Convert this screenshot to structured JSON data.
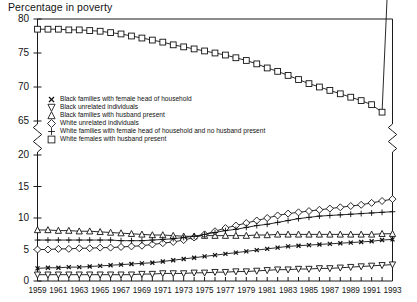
{
  "chart_data": {
    "type": "line",
    "title": "Percentage in poverty",
    "xlabel": "",
    "ylabel": "Percentage in poverty",
    "grid": false,
    "legend_position": "inside-upper-left",
    "axis_break": {
      "present": true,
      "between": [
        65,
        20
      ],
      "style": "zigzag",
      "on": [
        "y-axis-left",
        "y-axis-right"
      ]
    },
    "ylim_upper": [
      65,
      80
    ],
    "ylim_lower": [
      0,
      20
    ],
    "ytick_labels": [
      "80",
      "75",
      "70",
      "65",
      "20",
      "15",
      "10",
      "5",
      "0"
    ],
    "ytick_values": [
      80,
      75,
      70,
      65,
      20,
      15,
      10,
      5,
      0
    ],
    "x": [
      1959,
      1960,
      1961,
      1962,
      1963,
      1964,
      1965,
      1966,
      1967,
      1968,
      1969,
      1970,
      1971,
      1972,
      1973,
      1974,
      1975,
      1976,
      1977,
      1978,
      1979,
      1980,
      1981,
      1982,
      1983,
      1984,
      1985,
      1986,
      1987,
      1988,
      1989,
      1990,
      1991,
      1992,
      1993
    ],
    "xtick_labels": [
      "1959",
      "1961",
      "1963",
      "1965",
      "1967",
      "1969",
      "1971",
      "1973",
      "1975",
      "1977",
      "1979",
      "1981",
      "1983",
      "1985",
      "1987",
      "1989",
      "1991",
      "1993"
    ],
    "xlim": [
      1959,
      1993
    ],
    "series": [
      {
        "name": "Black families with female head of household",
        "marker": "x",
        "values": [
          2.0,
          2.1,
          2.1,
          2.2,
          2.2,
          2.3,
          2.4,
          2.5,
          2.6,
          2.7,
          2.8,
          2.9,
          3.1,
          3.3,
          3.5,
          3.7,
          3.9,
          4.1,
          4.3,
          4.5,
          4.7,
          4.9,
          5.1,
          5.3,
          5.5,
          5.6,
          5.7,
          5.8,
          5.9,
          6.0,
          6.1,
          6.2,
          6.3,
          6.5,
          6.6
        ]
      },
      {
        "name": "Black unrelated individuals",
        "marker": "triangle-down",
        "values": [
          1.0,
          1.0,
          1.0,
          1.0,
          1.0,
          1.0,
          1.0,
          1.0,
          1.0,
          1.0,
          1.1,
          1.1,
          1.2,
          1.2,
          1.2,
          1.3,
          1.3,
          1.4,
          1.4,
          1.5,
          1.5,
          1.6,
          1.7,
          1.8,
          1.8,
          1.9,
          1.9,
          2.0,
          2.0,
          2.1,
          2.2,
          2.3,
          2.4,
          2.5,
          2.6
        ]
      },
      {
        "name": "Black families with husband present",
        "marker": "triangle-up",
        "values": [
          8.1,
          8.1,
          8.0,
          8.0,
          7.9,
          7.9,
          7.8,
          7.7,
          7.6,
          7.5,
          7.4,
          7.3,
          7.3,
          7.2,
          7.1,
          7.1,
          7.2,
          7.2,
          7.2,
          7.2,
          7.2,
          7.3,
          7.3,
          7.4,
          7.4,
          7.4,
          7.4,
          7.4,
          7.4,
          7.4,
          7.4,
          7.4,
          7.4,
          7.5,
          7.5
        ]
      },
      {
        "name": "White unrelated individuals",
        "marker": "diamond",
        "values": [
          5.0,
          5.0,
          5.1,
          5.1,
          5.2,
          5.2,
          5.3,
          5.3,
          5.4,
          5.5,
          5.6,
          5.8,
          6.0,
          6.2,
          6.5,
          6.9,
          7.4,
          7.9,
          8.4,
          8.8,
          9.2,
          9.6,
          10.0,
          10.4,
          10.7,
          10.9,
          11.1,
          11.3,
          11.5,
          11.7,
          11.9,
          12.1,
          12.4,
          12.7,
          13.0
        ]
      },
      {
        "name": "White families with female head of household and no husband present",
        "marker": "plus",
        "values": [
          6.5,
          6.5,
          6.5,
          6.5,
          6.5,
          6.5,
          6.5,
          6.5,
          6.4,
          6.4,
          6.4,
          6.5,
          6.6,
          6.7,
          6.9,
          7.1,
          7.4,
          7.7,
          8.0,
          8.2,
          8.5,
          8.8,
          9.0,
          9.3,
          9.6,
          9.9,
          10.1,
          10.3,
          10.4,
          10.5,
          10.6,
          10.7,
          10.8,
          10.9,
          11.0
        ]
      },
      {
        "name": "White females with husband present",
        "marker": "square",
        "values": [
          78.5,
          78.5,
          78.5,
          78.4,
          78.4,
          78.3,
          78.2,
          78.0,
          77.8,
          77.5,
          77.2,
          76.9,
          76.6,
          76.2,
          75.9,
          75.6,
          75.3,
          75.0,
          74.7,
          74.3,
          73.9,
          73.4,
          72.8,
          72.3,
          71.7,
          71.1,
          70.5,
          70.0,
          69.5,
          69.0,
          68.5,
          68.0,
          67.4,
          66.3,
          64.5
        ]
      }
    ]
  }
}
